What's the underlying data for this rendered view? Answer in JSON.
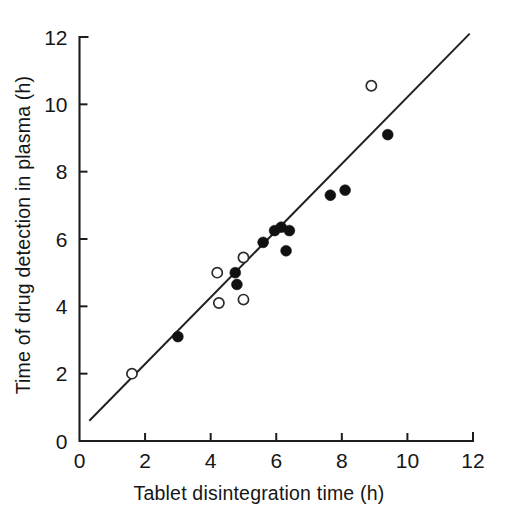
{
  "chart_data": {
    "type": "scatter",
    "title": "",
    "xlabel": "Tablet disintegration time (h)",
    "ylabel": "Time of drug detection in plasma (h)",
    "xlim": [
      0,
      12
    ],
    "ylim": [
      0,
      12
    ],
    "xticks": [
      0,
      2,
      4,
      6,
      8,
      10,
      12
    ],
    "yticks": [
      0,
      2,
      4,
      6,
      8,
      10,
      12
    ],
    "xtick_labels": [
      "0",
      "2",
      "4",
      "6",
      "8",
      "10",
      "12"
    ],
    "ytick_labels": [
      "0",
      "2",
      "4",
      "6",
      "8",
      "10",
      "12"
    ],
    "grid": false,
    "legend": "none",
    "series": [
      {
        "name": "filled-circles",
        "marker": "filled-circle",
        "color": "#111111",
        "points": [
          {
            "x": 3.0,
            "y": 3.1
          },
          {
            "x": 4.75,
            "y": 5.0
          },
          {
            "x": 4.8,
            "y": 4.65
          },
          {
            "x": 5.6,
            "y": 5.9
          },
          {
            "x": 5.95,
            "y": 6.25
          },
          {
            "x": 6.15,
            "y": 6.35
          },
          {
            "x": 6.4,
            "y": 6.25
          },
          {
            "x": 6.3,
            "y": 5.65
          },
          {
            "x": 7.65,
            "y": 7.3
          },
          {
            "x": 8.1,
            "y": 7.45
          },
          {
            "x": 9.4,
            "y": 9.1
          }
        ]
      },
      {
        "name": "open-circles",
        "marker": "open-circle",
        "color": "#ffffff",
        "points": [
          {
            "x": 1.6,
            "y": 2.0
          },
          {
            "x": 4.2,
            "y": 5.0
          },
          {
            "x": 4.25,
            "y": 4.1
          },
          {
            "x": 5.0,
            "y": 5.45
          },
          {
            "x": 5.0,
            "y": 4.2
          },
          {
            "x": 8.9,
            "y": 10.55
          }
        ]
      }
    ],
    "fit_line": {
      "name": "regression-line",
      "x1": 0.3,
      "y1": 0.6,
      "x2": 11.9,
      "y2": 12.1,
      "color": "#222222"
    }
  },
  "figure": {
    "background": "#ffffff",
    "axis_color": "#1d1d1d",
    "text_color": "#161616"
  }
}
